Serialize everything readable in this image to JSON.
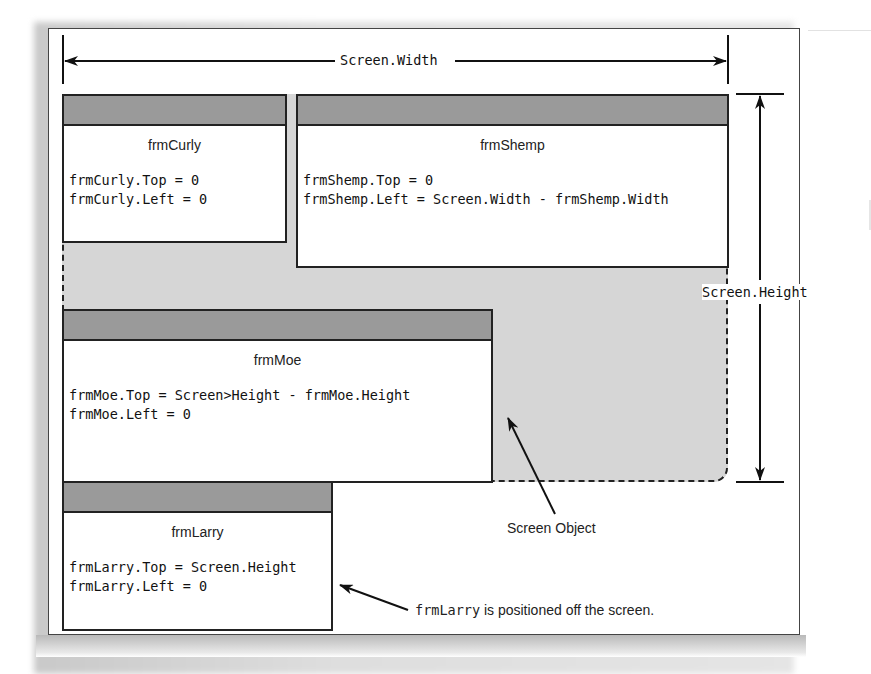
{
  "diagram": {
    "dimension_labels": {
      "width": "Screen.Width",
      "height": "Screen.Height"
    },
    "forms": [
      {
        "id": "frmCurly",
        "title": "frmCurly",
        "code": [
          "frmCurly.Top = 0",
          "frmCurly.Left = 0"
        ]
      },
      {
        "id": "frmShemp",
        "title": "frmShemp",
        "code": [
          "frmShemp.Top = 0",
          "frmShemp.Left = Screen.Width - frmShemp.Width"
        ]
      },
      {
        "id": "frmMoe",
        "title": "frmMoe",
        "code": [
          "frmMoe.Top = Screen>Height - frmMoe.Height",
          "frmMoe.Left = 0"
        ]
      },
      {
        "id": "frmLarry",
        "title": "frmLarry",
        "code": [
          "frmLarry.Top = Screen.Height",
          "frmLarry.Left = 0"
        ]
      }
    ],
    "callouts": {
      "screen_object": "Screen Object",
      "larry_note_code": "frmLarry",
      "larry_note_text": " is positioned off the screen."
    },
    "colors": {
      "screen_fill": "#d6d6d6",
      "titlebar": "#9a9a9a",
      "line": "#222222"
    }
  }
}
